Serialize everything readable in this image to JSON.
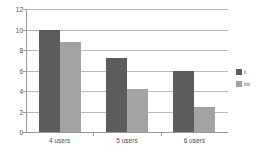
{
  "chart_data": {
    "type": "bar",
    "title": "",
    "subtitle": "",
    "xlabel": "",
    "ylabel": "",
    "categories": [
      "4 users",
      "5 users",
      "6 users"
    ],
    "series": [
      {
        "name": "ii",
        "values": [
          10.0,
          7.2,
          6.0
        ],
        "color": "#5c5c5c"
      },
      {
        "name": "int",
        "values": [
          8.75,
          4.2,
          2.4
        ],
        "color": "#a3a3a3"
      }
    ],
    "ylim": [
      0,
      12
    ],
    "ytick_labels": [
      "0",
      "2",
      "4",
      "6",
      "8",
      "10",
      "12"
    ],
    "ytick_values": [
      0,
      2,
      4,
      6,
      8,
      10,
      12
    ],
    "grid": true,
    "grid_axis": "y",
    "legend_position": "right",
    "gridline_color": "#b9b9b9",
    "axis_color": "#9a9a9a",
    "background_color": "#ffffff"
  }
}
